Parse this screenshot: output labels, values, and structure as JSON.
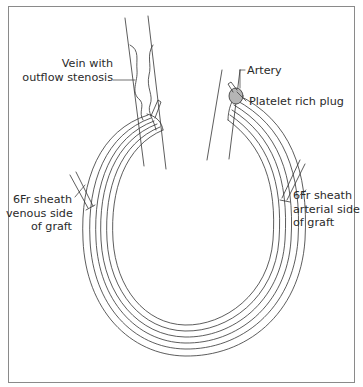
{
  "diagram": {
    "type": "anatomical-illustration",
    "colors": {
      "stroke": "#333333",
      "frame": "#8a8a8a",
      "plug_fill": "#b5b5b5",
      "background": "#ffffff"
    },
    "labels": {
      "vein": {
        "lines": [
          "Vein with",
          "outflow stenosis"
        ]
      },
      "artery": {
        "lines": [
          "Artery"
        ]
      },
      "plug": {
        "lines": [
          "Platelet rich plug"
        ]
      },
      "venous_sheath": {
        "lines": [
          "6Fr sheath",
          "venous side",
          "of graft"
        ]
      },
      "arterial_sheath": {
        "lines": [
          "6Fr sheath",
          "arterial side",
          "of graft"
        ]
      }
    }
  }
}
